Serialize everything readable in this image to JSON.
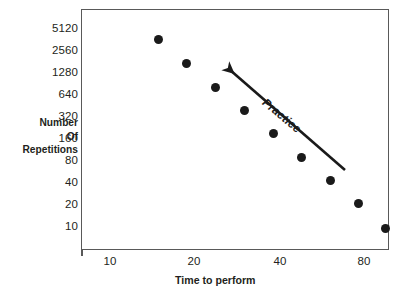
{
  "chart_data": {
    "type": "scatter",
    "title": "",
    "subtitle": "",
    "xlabel": "Time to perform",
    "ylabel": "Number Of Repetitions",
    "ylabel_lines": [
      "Number",
      "Of",
      "Repetitions"
    ],
    "xscale": "log",
    "yscale": "log",
    "grid": false,
    "legend": null,
    "xlim": [
      8.4,
      95
    ],
    "ylim": [
      8.0,
      7200
    ],
    "xticks": [
      10,
      20,
      40,
      80
    ],
    "xtick_labels": [
      "10",
      "20",
      "40",
      "80"
    ],
    "yticks": [
      10,
      20,
      40,
      80,
      160,
      320,
      640,
      1280,
      2560,
      5120
    ],
    "ytick_labels": [
      "5120",
      "2560",
      "1280",
      "640",
      "320",
      "160",
      "80",
      "40",
      "20",
      "10"
    ],
    "marker": {
      "shape": "circle",
      "color": "#1a1a1a",
      "size_px": 9
    },
    "series": [
      {
        "name": "observations",
        "x": [
          13,
          18,
          24,
          31,
          39,
          48,
          59,
          72,
          85
        ],
        "y": [
          3400,
          1600,
          790,
          380,
          185,
          93,
          46,
          22,
          11
        ]
      }
    ],
    "annotations": [
      {
        "type": "arrow",
        "text": "Practice",
        "color": "#1a1a1a",
        "direction": "up-left",
        "tail_xy": [
          75,
          55
        ],
        "head_xy": [
          26,
          1500
        ],
        "text_rotation_deg": 40
      }
    ]
  },
  "axes": {
    "y_ticks": [
      {
        "label": "5120",
        "top": 23
      },
      {
        "label": "2560",
        "top": 45
      },
      {
        "label": "1280",
        "top": 67
      },
      {
        "label": "640",
        "top": 89
      },
      {
        "label": "320",
        "top": 111
      },
      {
        "label": "160",
        "top": 133
      },
      {
        "label": "80",
        "top": 155
      },
      {
        "label": "40",
        "top": 177
      },
      {
        "label": "20",
        "top": 199
      },
      {
        "label": "10",
        "top": 221
      }
    ],
    "x_ticks": [
      {
        "label": "10",
        "left": 110
      },
      {
        "label": "20",
        "left": 194
      },
      {
        "label": "40",
        "left": 280
      },
      {
        "label": "80",
        "left": 364
      }
    ]
  },
  "points": [
    {
      "left": 158,
      "top": 39
    },
    {
      "left": 186,
      "top": 63
    },
    {
      "left": 215,
      "top": 87
    },
    {
      "left": 244,
      "top": 110
    },
    {
      "left": 273,
      "top": 133
    },
    {
      "left": 301,
      "top": 157
    },
    {
      "left": 330,
      "top": 180
    },
    {
      "left": 358,
      "top": 203
    },
    {
      "left": 385,
      "top": 228
    }
  ],
  "annotation": {
    "label": "Practice",
    "arrow_tail_x": 345,
    "arrow_tail_y": 170,
    "arrow_head_x": 222,
    "arrow_head_y": 63,
    "color": "#1a1a1a"
  },
  "axis_titles": {
    "y_line1": "Number",
    "y_line2": "Of",
    "y_line3": "Repetitions",
    "x": "Time to perform"
  }
}
